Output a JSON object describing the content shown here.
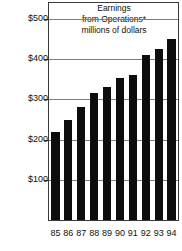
{
  "chart_data": {
    "type": "bar",
    "title": "Earnings from Operations* millions of dollars",
    "title_lines": [
      "Earnings",
      "from Operations*",
      "millions of dollars"
    ],
    "xlabel": "",
    "ylabel": "",
    "categories": [
      "85",
      "86",
      "87",
      "88",
      "89",
      "90",
      "91",
      "92",
      "93",
      "94"
    ],
    "values": [
      218,
      250,
      280,
      315,
      330,
      353,
      360,
      410,
      425,
      450
    ],
    "ylim": [
      0,
      540
    ],
    "yticks": [
      100,
      200,
      300,
      400,
      500
    ],
    "ytick_labels": [
      "$100",
      "$200",
      "$300",
      "$400",
      "$500"
    ],
    "grid": true,
    "legend": "none",
    "bar_color": "#0d0d0d",
    "gridline_color": "#7d7d7d",
    "frame_color": "#3a3a3a"
  },
  "title": {
    "line1": "Earnings",
    "line2": "from Operations*",
    "line3": "millions of dollars"
  },
  "axis": {
    "y_labels": [
      "$500",
      "$400",
      "$300",
      "$200",
      "$100"
    ],
    "x_labels": [
      "85",
      "86",
      "87",
      "88",
      "89",
      "90",
      "91",
      "92",
      "93",
      "94"
    ]
  }
}
